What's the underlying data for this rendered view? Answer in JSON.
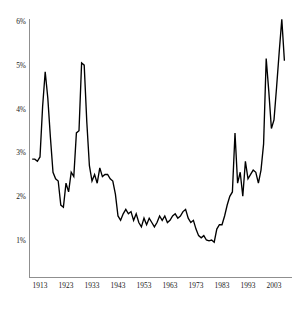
{
  "chart_data": {
    "type": "line",
    "title": "",
    "subtitle": "",
    "xlabel": "",
    "ylabel": "",
    "grid": false,
    "legend": "none",
    "xlim": [
      1910,
      2007
    ],
    "ylim": [
      0,
      6.2
    ],
    "y_ticks": [
      1,
      2,
      3,
      4,
      5,
      6
    ],
    "y_tick_labels": [
      "1%",
      "2%",
      "3%",
      "4%",
      "5%",
      "6%"
    ],
    "x_ticks": [
      1913,
      1923,
      1933,
      1943,
      1953,
      1963,
      1973,
      1983,
      1993,
      2003
    ],
    "x_tick_labels": [
      "1913",
      "1923",
      "1933",
      "1943",
      "1953",
      "1963",
      "1973",
      "1983",
      "1993",
      "2003"
    ],
    "line_color": "#000000",
    "axis_color": "#8f8f8f",
    "series": [
      {
        "name": "share",
        "x": [
          1910,
          1911,
          1912,
          1913,
          1914,
          1915,
          1916,
          1917,
          1918,
          1919,
          1920,
          1921,
          1922,
          1923,
          1924,
          1925,
          1926,
          1927,
          1928,
          1929,
          1930,
          1931,
          1932,
          1933,
          1934,
          1935,
          1936,
          1937,
          1938,
          1939,
          1940,
          1941,
          1942,
          1943,
          1944,
          1945,
          1946,
          1947,
          1948,
          1949,
          1950,
          1951,
          1952,
          1953,
          1954,
          1955,
          1956,
          1957,
          1958,
          1959,
          1960,
          1961,
          1962,
          1963,
          1964,
          1965,
          1966,
          1967,
          1968,
          1969,
          1970,
          1971,
          1972,
          1973,
          1974,
          1975,
          1976,
          1977,
          1978,
          1979,
          1980,
          1981,
          1982,
          1983,
          1984,
          1985,
          1986,
          1987,
          1988,
          1989,
          1990,
          1991,
          1992,
          1993,
          1994,
          1995,
          1996,
          1997,
          1998,
          1999,
          2000,
          2001,
          2002,
          2003,
          2004,
          2005,
          2006,
          2007
        ],
        "values": [
          2.85,
          2.85,
          2.8,
          2.9,
          4.05,
          4.85,
          4.25,
          3.35,
          2.55,
          2.4,
          2.35,
          1.8,
          1.75,
          2.3,
          2.1,
          2.55,
          2.45,
          3.45,
          3.5,
          5.05,
          5.0,
          3.7,
          2.7,
          2.35,
          2.5,
          2.3,
          2.65,
          2.45,
          2.5,
          2.5,
          2.4,
          2.35,
          2.05,
          1.55,
          1.45,
          1.6,
          1.7,
          1.6,
          1.65,
          1.45,
          1.6,
          1.4,
          1.3,
          1.5,
          1.35,
          1.5,
          1.4,
          1.3,
          1.4,
          1.55,
          1.45,
          1.55,
          1.4,
          1.45,
          1.55,
          1.6,
          1.5,
          1.55,
          1.65,
          1.7,
          1.5,
          1.4,
          1.45,
          1.25,
          1.1,
          1.05,
          1.1,
          1.0,
          0.98,
          1.0,
          0.95,
          1.25,
          1.35,
          1.35,
          1.55,
          1.8,
          2.0,
          2.1,
          3.45,
          2.3,
          2.55,
          2.0,
          2.8,
          2.4,
          2.5,
          2.6,
          2.55,
          2.3,
          2.6,
          3.2,
          5.15,
          4.4,
          3.55,
          3.75,
          4.5,
          5.3,
          6.05,
          5.1
        ],
        "peaks": [
          {
            "year": 1915,
            "value": 4.85
          },
          {
            "year": 1929,
            "value": 5.05
          },
          {
            "year": 1988,
            "value": 3.45
          },
          {
            "year": 2000,
            "value": 5.15
          },
          {
            "year": 2006,
            "value": 6.05
          }
        ],
        "troughs": [
          {
            "year": 1922,
            "value": 1.75
          },
          {
            "year": 1980,
            "value": 0.95
          }
        ]
      }
    ]
  }
}
